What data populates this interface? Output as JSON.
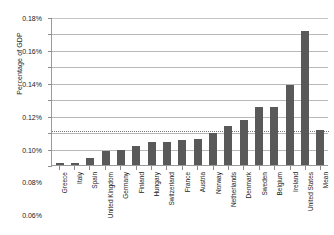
{
  "chart_data": {
    "type": "bar",
    "title": "",
    "xlabel": "",
    "ylabel": "Percentage of GDP",
    "ylim": [
      0,
      0.0018
    ],
    "ytick_labels": [
      "0.18%",
      "0.16%",
      "0.14%",
      "0.12%",
      "0.10%",
      "0.08%",
      "0.06%",
      "0.04%",
      "0.02%",
      "0.00%"
    ],
    "ytick_values": [
      0.18,
      0.16,
      0.14,
      0.12,
      0.1,
      0.08,
      0.06,
      0.04,
      0.02,
      0.0
    ],
    "y_unit": "percent",
    "grid": true,
    "legend": "none",
    "categories": [
      "Greece",
      "Italy",
      "Spain",
      "United Kingdom",
      "Germany",
      "Finland",
      "Hungary",
      "Switzerland",
      "France",
      "Austria",
      "Norway",
      "Netherlands",
      "Denmark",
      "Sweden",
      "Belgium",
      "Ireland",
      "United States",
      "Mean"
    ],
    "values": [
      0.002,
      0.002,
      0.008,
      0.0175,
      0.018,
      0.023,
      0.028,
      0.028,
      0.03,
      0.032,
      0.0385,
      0.047,
      0.055,
      0.07,
      0.071,
      0.097,
      0.163,
      0.043
    ],
    "annotations": [
      {
        "name": "mean-reference-line",
        "style": "dotted",
        "value": 0.043
      }
    ],
    "colors": {
      "bar": "#595959",
      "gridline": "#b8b8b8",
      "axis": "#9a9a9a",
      "mean_line": "#777777",
      "text": "#1a1a1a",
      "background": "#ffffff"
    }
  }
}
